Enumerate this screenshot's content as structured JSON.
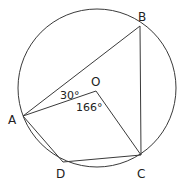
{
  "diagram": {
    "type": "circle-geometry",
    "circle": {
      "center_label": "O"
    },
    "points": {
      "A": {
        "label": "A"
      },
      "B": {
        "label": "B"
      },
      "C": {
        "label": "C"
      },
      "D": {
        "label": "D"
      },
      "O": {
        "label": "O"
      }
    },
    "segments": [
      "AB",
      "BC",
      "AO",
      "OC",
      "AD",
      "DC"
    ],
    "angles": {
      "BAO": "30°",
      "AOC": "166°"
    }
  }
}
